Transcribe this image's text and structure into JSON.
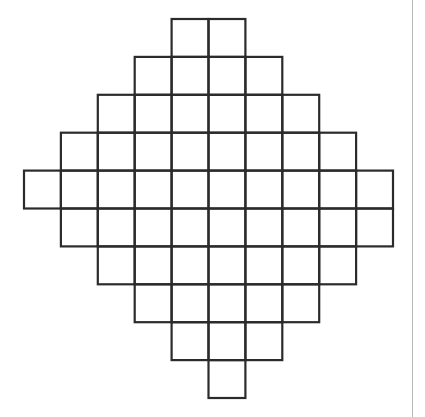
{
  "figure": {
    "origin_x": 24,
    "origin_y": 19,
    "cell_w": 36.9,
    "cell_h": 37.9,
    "stroke_color": "#2b2b2b",
    "stroke_width": 2.2,
    "rows": [
      {
        "row": 0,
        "start_col": 4,
        "end_col": 5
      },
      {
        "row": 1,
        "start_col": 3,
        "end_col": 6
      },
      {
        "row": 2,
        "start_col": 2,
        "end_col": 7
      },
      {
        "row": 3,
        "start_col": 1,
        "end_col": 8
      },
      {
        "row": 4,
        "start_col": 0,
        "end_col": 9
      },
      {
        "row": 5,
        "start_col": 1,
        "end_col": 9
      },
      {
        "row": 6,
        "start_col": 2,
        "end_col": 8
      },
      {
        "row": 7,
        "start_col": 3,
        "end_col": 7
      },
      {
        "row": 8,
        "start_col": 4,
        "end_col": 6
      },
      {
        "row": 9,
        "start_col": 5,
        "end_col": 5
      }
    ],
    "total_squares": 58
  },
  "divider": {
    "color": "#b8b8b8"
  }
}
